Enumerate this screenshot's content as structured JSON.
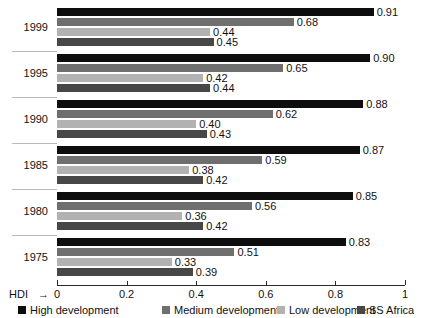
{
  "chart_data": {
    "type": "bar",
    "orientation": "horizontal",
    "title": "",
    "xlabel": "HDI",
    "ylabel": "",
    "xlim": [
      0,
      1
    ],
    "xticks": [
      "0",
      "0.2",
      "0.4",
      "0.6",
      "0.8",
      "1"
    ],
    "xtick_values": [
      0,
      0.2,
      0.4,
      0.6,
      0.8,
      1
    ],
    "grid": false,
    "legend_position": "bottom",
    "categories": [
      "1999",
      "1995",
      "1990",
      "1985",
      "1980",
      "1975"
    ],
    "series": [
      {
        "name": "High development",
        "color": "#0d0d0d",
        "values": [
          0.91,
          0.9,
          0.88,
          0.87,
          0.85,
          0.83
        ],
        "labels": [
          "0.91",
          "0.90",
          "0.88",
          "0.87",
          "0.85",
          "0.83"
        ]
      },
      {
        "name": "Medium development",
        "color": "#6f6f6f",
        "values": [
          0.68,
          0.65,
          0.62,
          0.59,
          0.56,
          0.51
        ],
        "labels": [
          "0.68",
          "0.65",
          "0.62",
          "0.59",
          "0.56",
          "0.51"
        ]
      },
      {
        "name": "Low development",
        "color": "#b2b2b2",
        "values": [
          0.44,
          0.42,
          0.4,
          0.38,
          0.36,
          0.33
        ],
        "labels": [
          "0.44",
          "0.42",
          "0.40",
          "0.38",
          "0.36",
          "0.33"
        ]
      },
      {
        "name": "SS Africa",
        "color": "#474747",
        "values": [
          0.45,
          0.44,
          0.43,
          0.42,
          0.42,
          0.39
        ],
        "labels": [
          "0.45",
          "0.44",
          "0.43",
          "0.42",
          "0.42",
          "0.39"
        ]
      }
    ]
  },
  "axis": {
    "x_title": "HDI",
    "arrow_glyph": "→"
  },
  "legend": {
    "items": [
      {
        "label": "High development",
        "color": "#0d0d0d"
      },
      {
        "label": "Medium development",
        "color": "#6f6f6f"
      },
      {
        "label": "Low development",
        "color": "#b2b2b2"
      },
      {
        "label": "SS Africa",
        "color": "#474747"
      }
    ]
  },
  "colors": {
    "background": "#ffffff",
    "text": "#111111",
    "axis": "#2b2b2b",
    "separator": "#b9b9b9"
  }
}
